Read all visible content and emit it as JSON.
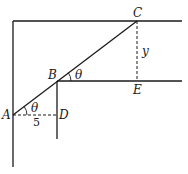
{
  "diagram": {
    "points": {
      "A": {
        "label": "A",
        "x": 13,
        "y": 115
      },
      "B": {
        "label": "B",
        "x": 57,
        "y": 81
      },
      "C": {
        "label": "C",
        "x": 137,
        "y": 21
      },
      "D": {
        "label": "D",
        "x": 57,
        "y": 115
      },
      "E": {
        "label": "E",
        "x": 137,
        "y": 81
      }
    },
    "angle_A_label": "θ",
    "angle_B_label": "θ",
    "segment_AD_label": "5",
    "segment_CE_label": "y",
    "line_color": "#1a1a1a"
  }
}
